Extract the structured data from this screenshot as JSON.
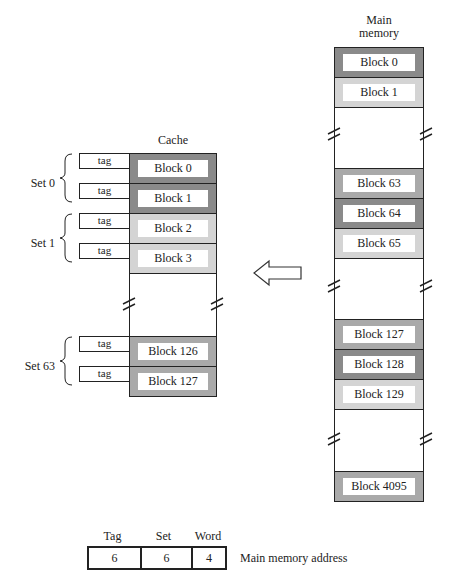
{
  "main_memory": {
    "title_line1": "Main",
    "title_line2": "memory",
    "blocks": [
      "Block 0",
      "Block 1",
      "Block 63",
      "Block 64",
      "Block 65",
      "Block 127",
      "Block 128",
      "Block 129",
      "Block 4095"
    ]
  },
  "cache": {
    "title": "Cache",
    "tag_label": "tag",
    "sets": [
      {
        "label": "Set 0",
        "blocks": [
          "Block 0",
          "Block 1"
        ]
      },
      {
        "label": "Set 1",
        "blocks": [
          "Block 2",
          "Block 3"
        ]
      },
      {
        "label": "Set 63",
        "blocks": [
          "Block 126",
          "Block 127"
        ]
      }
    ]
  },
  "address": {
    "fields": [
      {
        "name": "Tag",
        "bits": "6"
      },
      {
        "name": "Set",
        "bits": "6"
      },
      {
        "name": "Word",
        "bits": "4"
      }
    ],
    "caption": "Main memory address"
  },
  "colors": {
    "dark": "#8a8a8a",
    "mid": "#a9a9a9",
    "light": "#d4d4d4"
  }
}
